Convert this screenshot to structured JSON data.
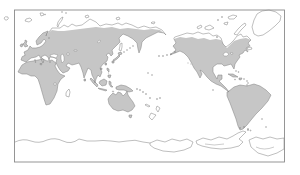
{
  "figure": {
    "type": "world-map"
  },
  "map": {
    "colors": {
      "background": "#ffffff",
      "land_fill": "#c6c6c6",
      "outline": "#7e7e7e",
      "frame": "#8a8a8a",
      "water": "#ffffff"
    },
    "shaded_regions": [
      "Eurasia",
      "Africa",
      "North America",
      "South America",
      "Australia",
      "New Guinea",
      "Indonesia",
      "Japan",
      "Philippines",
      "British Isles",
      "Cuba",
      "Hispaniola",
      "Tasmania",
      "Sri Lanka",
      "Taiwan",
      "Hawaii"
    ],
    "outline_only_regions": [
      "Antarctica",
      "Greenland",
      "Canadian Arctic Archipelago",
      "Iceland",
      "Svalbard",
      "Novaya Zemlya",
      "Severnaya Zemlya",
      "New Siberian Islands",
      "Wrangel Island",
      "Sakhalin",
      "Kuril Islands",
      "Newfoundland",
      "Madagascar",
      "New Zealand",
      "New Caledonia",
      "Solomon Islands",
      "Aleutian Islands",
      "Falkland Islands",
      "Lesser Antilles",
      "Pacific islands"
    ]
  }
}
